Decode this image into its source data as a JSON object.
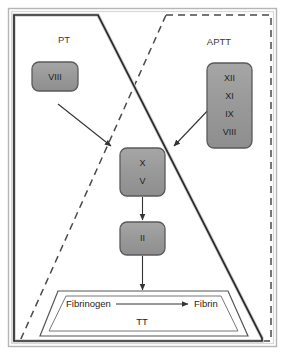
{
  "diagram": {
    "background_color": "#ffffff"
  },
  "regions": [
    {
      "id": "pt",
      "label": "PT",
      "line_style": "solid",
      "stroke_color": "#2b2b2b",
      "label_x": 64,
      "label_y": 40
    },
    {
      "id": "aptt",
      "label": "APTT",
      "line_style": "dashed",
      "stroke_color": "#4a4a4a",
      "label_x": 219,
      "label_y": 42
    }
  ],
  "factor_boxes": [
    {
      "id": "box-viii-left",
      "x": 32,
      "y": 62,
      "width": 46,
      "height": 29,
      "fill": "#9a9a9a",
      "stroke": "#5a5a5a",
      "lines": [
        "VIII"
      ]
    },
    {
      "id": "box-intrinsic-factors",
      "x": 207,
      "y": 63,
      "width": 45,
      "height": 85,
      "fill": "#9a9a9a",
      "stroke": "#5a5a5a",
      "lines": [
        "XII",
        "XI",
        "IX",
        "VIII"
      ]
    },
    {
      "id": "box-x-v",
      "x": 120,
      "y": 148,
      "width": 45,
      "height": 48,
      "fill": "#9a9a9a",
      "stroke": "#5a5a5a",
      "lines": [
        "X",
        "V"
      ]
    },
    {
      "id": "box-ii",
      "x": 120,
      "y": 222,
      "width": 45,
      "height": 33,
      "fill": "#9a9a9a",
      "stroke": "#5a5a5a",
      "lines": [
        "II"
      ]
    }
  ],
  "arrows": [
    {
      "id": "arrow-viii-to-xv",
      "from": "box-viii-left",
      "to": "box-x-v"
    },
    {
      "id": "arrow-intrinsic-to-xv",
      "from": "box-intrinsic-factors",
      "to": "box-x-v"
    },
    {
      "id": "arrow-xv-to-ii",
      "from": "box-x-v",
      "to": "box-ii"
    },
    {
      "id": "arrow-ii-to-tt",
      "from": "box-ii",
      "to": "tt-trapezoid"
    },
    {
      "id": "arrow-fibrinogen-to-fibrin",
      "from": "fibrinogen",
      "to": "fibrin"
    }
  ],
  "tt_region": {
    "id": "tt-trapezoid",
    "label": "TT",
    "label_x": 142,
    "label_y": 322,
    "stroke": "#555555",
    "fibrinogen": {
      "label": "Fibrinogen",
      "x": 66,
      "y": 304
    },
    "fibrin": {
      "label": "Fibrin",
      "x": 197,
      "y": 304
    }
  },
  "colors": {
    "box_fill": "#9a9a9a",
    "box_stroke": "#5a5a5a",
    "pt_stroke": "#2b2b2b",
    "aptt_stroke": "#4a4a4a",
    "arrow_stroke": "#333333",
    "frame_stroke": "#a8a8a8",
    "text": "#1e1e1e"
  }
}
